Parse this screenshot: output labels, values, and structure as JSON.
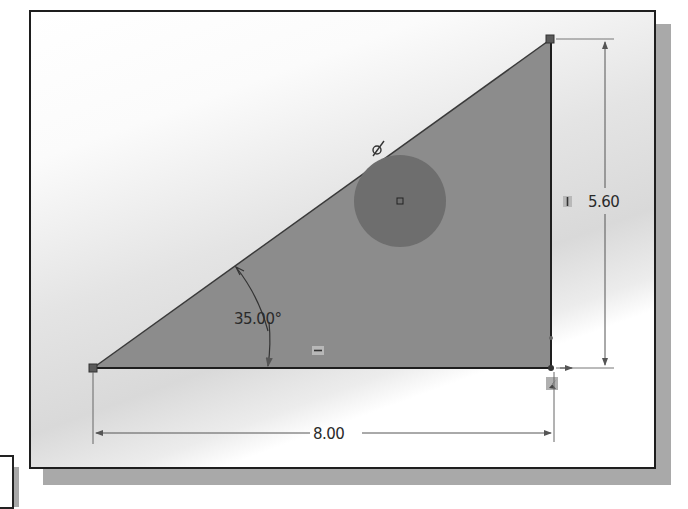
{
  "sketch": {
    "dimensions": {
      "height_value": "5.60",
      "width_value": "8.00",
      "angle_value": "35.00°"
    },
    "relations": {
      "vertical_icon": "vertical-relation-icon",
      "horizontal_icon": "horizontal-relation-icon",
      "tangent_icon": "tangent-relation-icon",
      "fix_icon": "fixed-relation-icon"
    },
    "colors": {
      "triangle_fill": "#8c8c8c",
      "circle_fill": "#6e6e6e",
      "edge": "#2a2a2a",
      "dimension_line": "#5a5a5a",
      "frame_border": "#1e1e1e",
      "frame_shadow": "#a9a9a9"
    }
  }
}
